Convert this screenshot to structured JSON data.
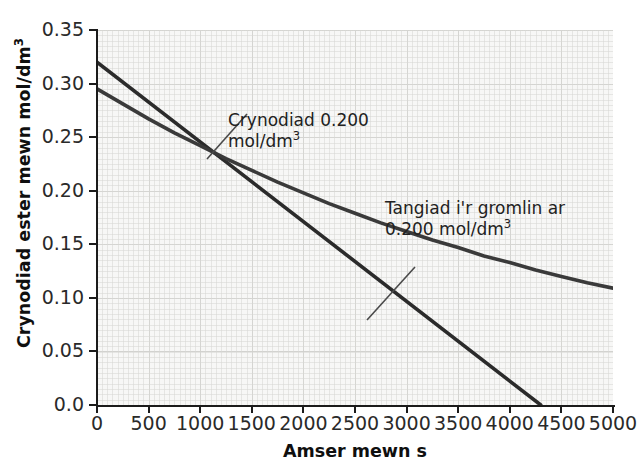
{
  "chart_data": {
    "type": "line",
    "title": "",
    "xlabel": "Amser mewn s",
    "ylabel": "Crynodiad ester mewn mol/dm",
    "ylabel_sup": "3",
    "xlim": [
      0,
      5000
    ],
    "ylim": [
      0.0,
      0.35
    ],
    "grid": true,
    "legend": "none",
    "xticks": [
      0,
      500,
      1000,
      1500,
      2000,
      2500,
      3000,
      3500,
      4000,
      4500,
      5000
    ],
    "xtick_labels": [
      "0",
      "500",
      "1000",
      "1500",
      "2000",
      "2500",
      "3000",
      "3500",
      "4000",
      "4500",
      "5000"
    ],
    "yticks": [
      0.0,
      0.05,
      0.1,
      0.15,
      0.2,
      0.25,
      0.3,
      0.35
    ],
    "ytick_labels": [
      "0.0",
      "0.05",
      "0.10",
      "0.15",
      "0.20",
      "0.25",
      "0.30",
      "0.35"
    ],
    "series": [
      {
        "name": "Cromlin crynodiad ester",
        "type": "curve",
        "color": "#3a3a3a",
        "x": [
          0,
          250,
          500,
          750,
          1000,
          1250,
          1500,
          1750,
          2000,
          2250,
          2500,
          2750,
          3000,
          3250,
          3500,
          3750,
          4000,
          4250,
          4500,
          4750,
          5000
        ],
        "y": [
          0.295,
          0.281,
          0.267,
          0.254,
          0.242,
          0.23,
          0.219,
          0.208,
          0.198,
          0.188,
          0.179,
          0.17,
          0.162,
          0.154,
          0.147,
          0.139,
          0.133,
          0.126,
          0.12,
          0.114,
          0.109
        ]
      },
      {
        "name": "Tangiad i'r gromlin ar 0.200 mol/dm3",
        "type": "line",
        "color": "#2b2b2b",
        "x": [
          0,
          4300
        ],
        "y": [
          0.32,
          0.0
        ]
      }
    ],
    "annotations": [
      {
        "id": "concentration",
        "text": "Crynodiad 0.200\nmol/dm",
        "sup": "3",
        "points_to_x": 1410,
        "points_to_y": 0.2
      },
      {
        "id": "tangent",
        "text": "Tangiad i'r gromlin ar\n0.200 mol/dm",
        "sup": "3",
        "points_to_x": 2890,
        "points_to_y": 0.103
      }
    ],
    "colors": {
      "plot_background": "#f7f7f6",
      "grid": "#d7d7d4",
      "axis": "#1b1b1b",
      "curve": "#3a3a3a",
      "tangent": "#2b2b2b",
      "text": "#222222"
    }
  }
}
